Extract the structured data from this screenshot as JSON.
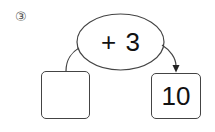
{
  "problem": {
    "number_label": "③",
    "operation_label": "+ 3",
    "input_box": {
      "value": ""
    },
    "output_box": {
      "value": "10"
    }
  },
  "colors": {
    "stroke": "#444444",
    "text": "#111111",
    "background": "#ffffff"
  }
}
